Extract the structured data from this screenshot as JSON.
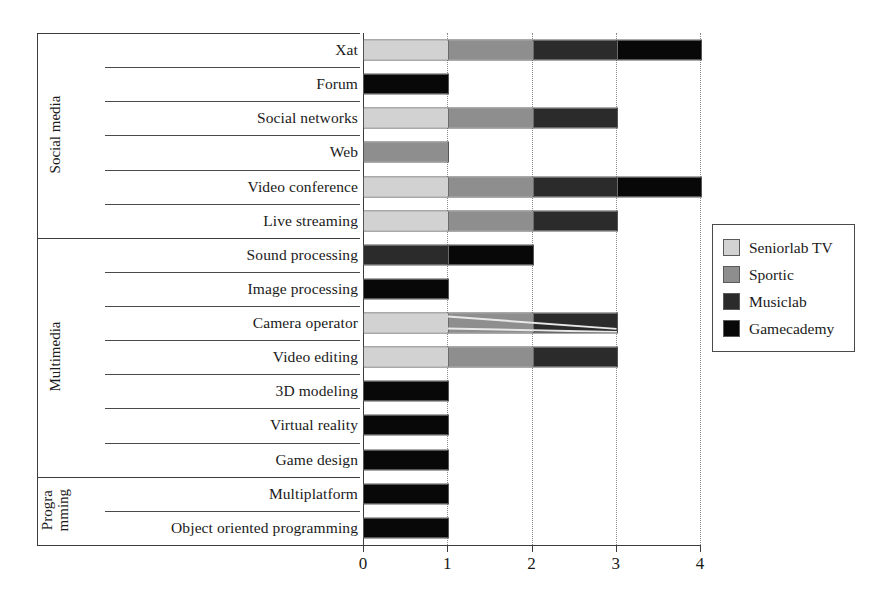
{
  "chart_data": {
    "type": "bar",
    "orientation": "horizontal",
    "stacked": true,
    "title": "",
    "xlabel": "",
    "ylabel": "",
    "xlim": [
      0,
      4
    ],
    "xticks": [
      "0",
      "1",
      "2",
      "3",
      "4"
    ],
    "grid": "vertical-dotted",
    "legend_position": "right",
    "series": [
      {
        "name": "Seniorlab TV",
        "color": "#d2d2d2"
      },
      {
        "name": "Sportic",
        "color": "#8e8e8e"
      },
      {
        "name": "Musiclab",
        "color": "#2b2b2b"
      },
      {
        "name": "Gamecademy",
        "color": "#080808"
      }
    ],
    "groups": [
      {
        "label": "Social media",
        "label_lines": [
          "Social media"
        ],
        "categories": [
          {
            "label": "Xat",
            "values": [
              1,
              1,
              1,
              1
            ],
            "total": 4
          },
          {
            "label": "Forum",
            "values": [
              0,
              0,
              0,
              1
            ],
            "total": 1
          },
          {
            "label": "Social networks",
            "values": [
              1,
              1,
              1,
              0
            ],
            "total": 3
          },
          {
            "label": "Web",
            "values": [
              0,
              1,
              0,
              0
            ],
            "total": 1
          },
          {
            "label": "Video conference",
            "values": [
              1,
              1,
              1,
              1
            ],
            "total": 4
          },
          {
            "label": "Live streaming",
            "values": [
              1,
              1,
              1,
              0
            ],
            "total": 3
          }
        ]
      },
      {
        "label": "Multimedia",
        "label_lines": [
          "Multimedia"
        ],
        "categories": [
          {
            "label": "Sound processing",
            "values": [
              0,
              0,
              1,
              1
            ],
            "total": 2
          },
          {
            "label": "Image processing",
            "values": [
              0,
              0,
              0,
              1
            ],
            "total": 1
          },
          {
            "label": "Camera operator",
            "values": [
              1,
              1,
              1,
              0
            ],
            "total": 3
          },
          {
            "label": "Video editing",
            "values": [
              1,
              1,
              1,
              0
            ],
            "total": 3
          },
          {
            "label": "3D modeling",
            "values": [
              0,
              0,
              0,
              1
            ],
            "total": 1
          },
          {
            "label": "Virtual reality",
            "values": [
              0,
              0,
              0,
              1
            ],
            "total": 1
          },
          {
            "label": "Game design",
            "values": [
              0,
              0,
              0,
              1
            ],
            "total": 1
          }
        ]
      },
      {
        "label": "Programming",
        "label_lines": [
          "Progra",
          "mming"
        ],
        "categories": [
          {
            "label": "Multiplatform",
            "values": [
              0,
              0,
              0,
              1
            ],
            "total": 1
          },
          {
            "label": "Object oriented programming",
            "values": [
              0,
              0,
              0,
              1
            ],
            "total": 1
          }
        ]
      }
    ]
  },
  "legend": {
    "items": [
      {
        "label": "Seniorlab TV",
        "color": "#d2d2d2"
      },
      {
        "label": "Sportic",
        "color": "#8e8e8e"
      },
      {
        "label": "Musiclab",
        "color": "#2b2b2b"
      },
      {
        "label": "Gamecademy",
        "color": "#080808"
      }
    ]
  },
  "axis": {
    "ticks": [
      "0",
      "1",
      "2",
      "3",
      "4"
    ]
  },
  "row_labels": [
    "Xat",
    "Forum",
    "Social networks",
    "Web",
    "Video conference",
    "Live streaming",
    "Sound processing",
    "Image processing",
    "Camera operator",
    "Video editing",
    "3D modeling",
    "Virtual reality",
    "Game design",
    "Multiplatform",
    "Object oriented programming"
  ],
  "group_labels": [
    "Social media",
    "Multimedia",
    "Progra mming"
  ]
}
